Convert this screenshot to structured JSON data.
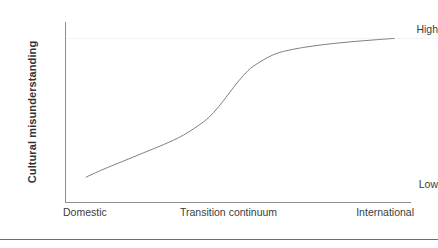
{
  "chart_data": {
    "type": "line",
    "title": "",
    "subtitle": "",
    "xlabel": "Transition continuum",
    "ylabel": "Cultural misunderstanding",
    "x_tick_labels": [
      "Domestic",
      "Transition continuum",
      "International"
    ],
    "y_tick_labels": [
      "Low",
      "High"
    ],
    "ylim": [
      0,
      1
    ],
    "xlim": [
      0,
      1
    ],
    "grid": true,
    "grid_lines": [
      "High"
    ],
    "legend": null,
    "legend_position": "none",
    "annotations": [],
    "series": [
      {
        "name": "Cultural misunderstanding",
        "shape": "sigmoid",
        "color": "#808080",
        "x": [
          0.061,
          0.11,
          0.168,
          0.226,
          0.284,
          0.342,
          0.4,
          0.43,
          0.458,
          0.487,
          0.516,
          0.545,
          0.603,
          0.661,
          0.719,
          0.777,
          0.835,
          0.893,
          0.951
        ],
        "y": [
          0.02,
          0.072,
          0.128,
          0.184,
          0.24,
          0.305,
          0.395,
          0.46,
          0.54,
          0.63,
          0.712,
          0.775,
          0.853,
          0.89,
          0.912,
          0.929,
          0.942,
          0.953,
          0.963
        ]
      }
    ]
  },
  "axis": {
    "y_title": "Cultural misunderstanding",
    "y_high": "High",
    "y_low": "Low",
    "x_left": "Domestic",
    "x_center": "Transition continuum",
    "x_right": "International"
  },
  "footer": {
    "clipped_text": ""
  },
  "colors": {
    "curve": "#808080",
    "axis": "#8e8e8e",
    "gridline": "#f2f4f6",
    "rule": "#6e6e6e",
    "text": "#3c3c3c",
    "title_text": "#333333",
    "background": "#ffffff"
  }
}
